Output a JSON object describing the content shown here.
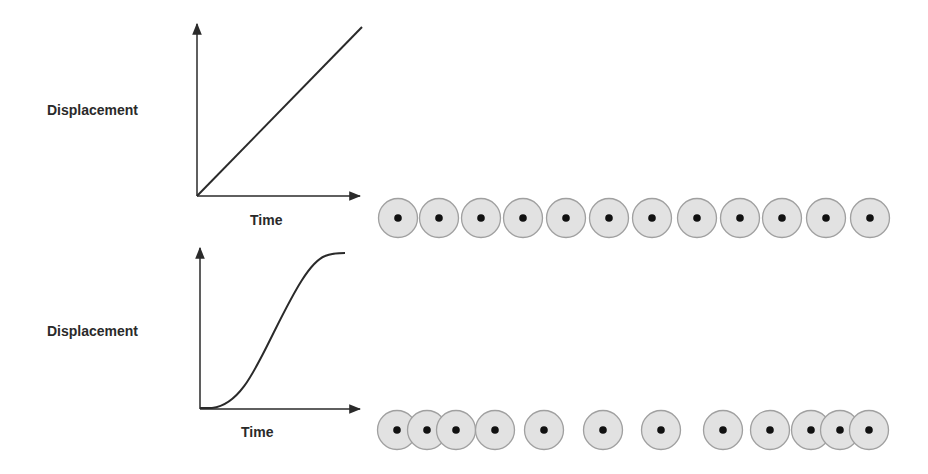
{
  "panels": [
    {
      "id": "constant-velocity",
      "ylabel": "Displacement",
      "xlabel": "Time",
      "curve": "linear",
      "particles_x": [
        398,
        439,
        481,
        523,
        566,
        609,
        652,
        697,
        740,
        782,
        826,
        870
      ]
    },
    {
      "id": "accelerating-decelerating",
      "ylabel": "Displacement",
      "xlabel": "Time",
      "curve": "s-curve",
      "particles_x": [
        397,
        427,
        456,
        495,
        544,
        603,
        661,
        723,
        770,
        811,
        840,
        869
      ]
    }
  ],
  "colors": {
    "axis": "#2a2a2a",
    "particle_fill": "#e2e2e2",
    "particle_stroke": "#a0a0a0",
    "particle_dot": "#111111"
  }
}
